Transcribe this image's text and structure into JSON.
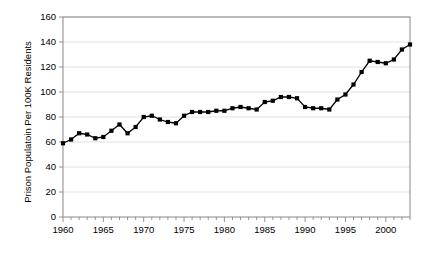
{
  "chart_data": {
    "type": "line",
    "title": "",
    "xlabel": "",
    "ylabel": "Prison Populatoin Per 100K Residents",
    "xlim": [
      1960,
      2003
    ],
    "ylim": [
      0,
      160
    ],
    "ytick_values": [
      0,
      20,
      40,
      60,
      80,
      100,
      120,
      140,
      160
    ],
    "ytick_labels": [
      "0",
      "20",
      "40",
      "60",
      "80",
      "100",
      "120",
      "140",
      "160"
    ],
    "xtick_values": [
      1960,
      1965,
      1970,
      1975,
      1980,
      1985,
      1990,
      1995,
      2000
    ],
    "xtick_labels": [
      "1960",
      "1965",
      "1970",
      "1975",
      "1980",
      "1985",
      "1990",
      "1995",
      "2000"
    ],
    "minor_xticks_every": 1,
    "grid": "horizontal",
    "legend": "none",
    "marker": "square",
    "marker_color": "#000000",
    "line_color": "#000000",
    "x": [
      1960,
      1961,
      1962,
      1963,
      1964,
      1965,
      1966,
      1967,
      1968,
      1969,
      1970,
      1971,
      1972,
      1973,
      1974,
      1975,
      1976,
      1977,
      1978,
      1979,
      1980,
      1981,
      1982,
      1983,
      1984,
      1985,
      1986,
      1987,
      1988,
      1989,
      1990,
      1991,
      1992,
      1993,
      1994,
      1995,
      1996,
      1997,
      1998,
      1999,
      2000,
      2001,
      2002,
      2003
    ],
    "values": [
      59,
      62,
      67,
      66,
      63,
      64,
      69,
      74,
      67,
      72,
      80,
      81,
      78,
      76,
      75,
      81,
      84,
      84,
      84,
      85,
      85,
      87,
      88,
      87,
      86,
      92,
      93,
      96,
      96,
      95,
      88,
      87,
      87,
      86,
      94,
      98,
      106,
      116,
      125,
      124,
      123,
      126,
      134,
      138
    ],
    "series": [
      {
        "name": "Prison Populatoin Per 100K Residents",
        "values": [
          59,
          62,
          67,
          66,
          63,
          64,
          69,
          74,
          67,
          72,
          80,
          81,
          78,
          76,
          75,
          81,
          84,
          84,
          84,
          85,
          85,
          87,
          88,
          87,
          86,
          92,
          93,
          96,
          96,
          95,
          88,
          87,
          87,
          86,
          94,
          98,
          106,
          116,
          125,
          124,
          123,
          126,
          134,
          138
        ]
      }
    ]
  },
  "colors": {
    "background": "#ffffff",
    "grid": "#d9d9d9",
    "axis": "#888888",
    "series": "#000000"
  }
}
